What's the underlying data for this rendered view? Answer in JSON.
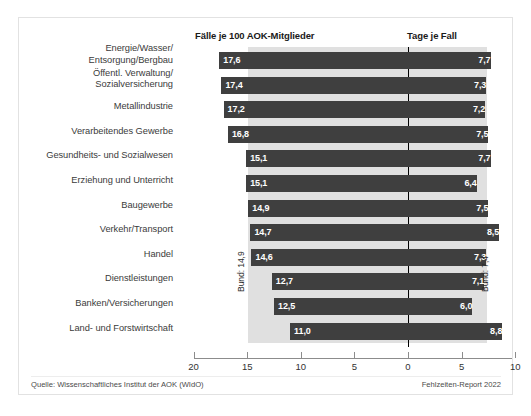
{
  "headers": {
    "left": "Fälle je 100 AOK-Mitglieder",
    "right": "Tage je Fall"
  },
  "footer": {
    "source": "Quelle: Wissenschaftliches Institut der AOK (WIdO)",
    "report": "Fehlzeiten-Report 2022"
  },
  "annotations": {
    "bund_left": "Bund: 14,9",
    "bund_right": "Bund: 7,4"
  },
  "colors": {
    "bar": "#3f3f3f",
    "band": "#e0e0e0",
    "zero_line": "#000000",
    "axis": "#8c8c8c",
    "label_text": "#3b3b3b",
    "value_text": "#ffffff",
    "frame": "#e2e2e2"
  },
  "chart_data": {
    "type": "bar",
    "title": "",
    "subtitle": "",
    "orientation": "horizontal",
    "layout": "diverging-double-axis",
    "categories": [
      "Energie/Wasser/\nEntsorgung/Bergbau",
      "Öffentl. Verwaltung/\nSozialversicherung",
      "Metallindustrie",
      "Verarbeitendes Gewerbe",
      "Gesundheits- und Sozialwesen",
      "Erziehung und Unterricht",
      "Baugewerbe",
      "Verkehr/Transport",
      "Handel",
      "Dienstleistungen",
      "Banken/Versicherungen",
      "Land- und Forstwirtschaft"
    ],
    "series": [
      {
        "name": "Fälle je 100 AOK-Mitglieder",
        "side": "left",
        "values": [
          17.6,
          17.4,
          17.2,
          16.8,
          15.1,
          15.1,
          14.9,
          14.7,
          14.6,
          12.7,
          12.5,
          11.0
        ],
        "labels": [
          "17,6",
          "17,4",
          "17,2",
          "16,8",
          "15,1",
          "15,1",
          "14,9",
          "14,7",
          "14,6",
          "12,7",
          "12,5",
          "11,0"
        ],
        "reference": 14.9,
        "reference_label": "Bund: 14,9"
      },
      {
        "name": "Tage je Fall",
        "side": "right",
        "values": [
          7.7,
          7.3,
          7.2,
          7.5,
          7.7,
          6.4,
          7.5,
          8.5,
          7.3,
          7.1,
          6.0,
          8.8
        ],
        "labels": [
          "7,7",
          "7,3",
          "7,2",
          "7,5",
          "7,7",
          "6,4",
          "7,5",
          "8,5",
          "7,3",
          "7,1",
          "6,0",
          "8,8"
        ],
        "reference": 7.4,
        "reference_label": "Bund: 7,4"
      }
    ],
    "xlabel": "",
    "ylabel": "",
    "xlim_left": [
      20,
      0
    ],
    "xlim_right": [
      0,
      10
    ],
    "xticks": [
      "20",
      "15",
      "10",
      "5",
      "0",
      "5",
      "10"
    ],
    "grid": false,
    "legend": "none"
  }
}
